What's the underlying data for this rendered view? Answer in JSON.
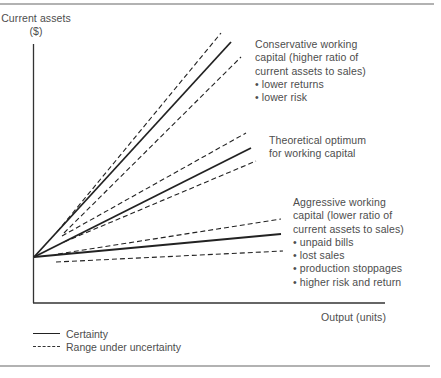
{
  "chart_data": {
    "type": "line",
    "title": "",
    "xlabel": "Output (units)",
    "ylabel_lines": [
      "Current assets",
      "($)"
    ],
    "grid": false,
    "legend_position": "bottom-left",
    "origin_px": [
      34,
      257
    ],
    "axes_px": {
      "y_top": 44,
      "x_axis_y": 303,
      "x_left": 33,
      "x_right": 385
    },
    "series": [
      {
        "name": "Conservative working capital",
        "style": "certainty",
        "line_px": {
          "certainty": [
            [
              34,
              257
            ],
            [
              231,
              42
            ]
          ],
          "upper": [
            [
              57,
              232
            ],
            [
              221,
              33
            ]
          ],
          "lower": [
            [
              64,
              233
            ],
            [
              241,
              57
            ]
          ]
        },
        "annotation": [
          "Conservative working",
          "capital (higher ratio of",
          "current assets to sales)",
          "• lower returns",
          "• lower risk"
        ],
        "annotation_pos": [
          255,
          38
        ]
      },
      {
        "name": "Theoretical optimum for working capital",
        "line_px": {
          "certainty": [
            [
              34,
              257
            ],
            [
              251,
              148
            ]
          ],
          "upper": [
            [
              62,
              236
            ],
            [
              246,
              133
            ]
          ],
          "lower": [
            [
              64,
              242
            ],
            [
              256,
              161
            ]
          ]
        },
        "annotation": [
          "Theoretical optimum",
          "for working capital"
        ],
        "annotation_pos": [
          269,
          134
        ]
      },
      {
        "name": "Aggressive working capital",
        "line_px": {
          "certainty": [
            [
              34,
              257
            ],
            [
              281,
              234
            ]
          ],
          "upper": [
            [
              58,
              254
            ],
            [
              281,
              219
            ]
          ],
          "lower": [
            [
              56,
              262
            ],
            [
              283,
              251
            ]
          ]
        },
        "annotation": [
          "Aggressive working",
          "capital (lower ratio of",
          "current assets to sales)",
          "• unpaid bills",
          "• lost sales",
          "• production stoppages",
          "• higher risk and return"
        ],
        "annotation_pos": [
          293,
          196
        ]
      }
    ],
    "legend": [
      {
        "style": "solid",
        "label": "Certainty"
      },
      {
        "style": "dashed",
        "label": "Range under uncertainty"
      }
    ]
  },
  "colors": {
    "line": "#222222",
    "text": "#4d4d4d",
    "border": "#555555"
  },
  "ylabel": {
    "line1": "Current assets",
    "line2": "($)"
  },
  "xlabel": "Output (units)",
  "annotations": {
    "conservative": "Conservative working\ncapital (higher ratio of\ncurrent assets to sales)\n• lower returns\n• lower risk",
    "optimum": "Theoretical optimum\nfor working capital",
    "aggressive": "Aggressive working\ncapital (lower ratio of\ncurrent assets to sales)\n• unpaid bills\n• lost sales\n• production stoppages\n• higher risk and return"
  },
  "legend": {
    "certainty": "Certainty",
    "uncertainty": "Range under uncertainty"
  }
}
